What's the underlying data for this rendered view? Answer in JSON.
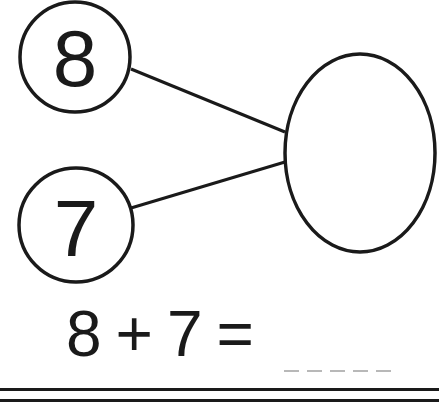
{
  "worksheet": {
    "part_circles": [
      {
        "value": "8",
        "cx": 75,
        "cy": 57,
        "r": 55
      },
      {
        "value": "7",
        "cx": 76,
        "cy": 225,
        "r": 57
      }
    ],
    "whole_ellipse": {
      "value": "",
      "cx": 360,
      "cy": 153,
      "rx": 75,
      "ry": 99
    },
    "equation": {
      "addend_1": "8",
      "operator": "+",
      "addend_2": "7",
      "equals": "=",
      "answer": ""
    },
    "answer_dash_count": 5,
    "colors": {
      "ink": "#1a1a1a",
      "dash": "#b8b8b8",
      "background": "#ffffff"
    }
  }
}
